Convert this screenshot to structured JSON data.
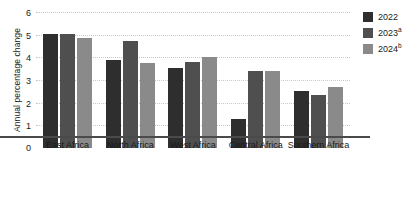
{
  "chart_data": {
    "type": "bar",
    "title": "",
    "xlabel": "",
    "ylabel": "Annual percentage change",
    "ylim": [
      0,
      6
    ],
    "yticks": [
      0,
      1,
      2,
      3,
      4,
      5,
      6
    ],
    "ytick_labels": [
      "0",
      "1",
      "2",
      "3",
      "4",
      "5",
      "6"
    ],
    "grid": true,
    "legend_position": "right",
    "categories": [
      "East Africa",
      "North Africa",
      "West Africa",
      "Central Africa",
      "Southern Africa"
    ],
    "series": [
      {
        "name": "2022",
        "note": "",
        "color": "#2e2e2e",
        "values": [
          5.05,
          3.9,
          3.55,
          1.3,
          2.5
        ]
      },
      {
        "name": "2023",
        "note": "a",
        "color": "#4f4f4f",
        "values": [
          5.05,
          4.7,
          3.8,
          3.4,
          2.35
        ]
      },
      {
        "name": "2024",
        "note": "b",
        "color": "#8a8a8a",
        "values": [
          4.85,
          3.75,
          4.0,
          3.4,
          2.7
        ]
      }
    ]
  },
  "legend": {
    "items": [
      {
        "label": "2022",
        "note": ""
      },
      {
        "label": "2023",
        "note": "a"
      },
      {
        "label": "2024",
        "note": "b"
      }
    ]
  }
}
